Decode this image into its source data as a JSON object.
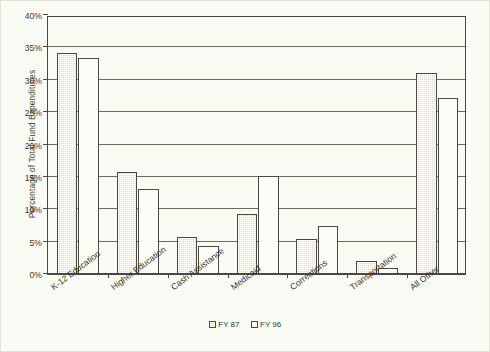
{
  "chart_data": {
    "type": "bar",
    "title": "",
    "subtitle": "",
    "xlabel": "",
    "ylabel": "Percentage of Total Fund Expenditures",
    "ylim": [
      0,
      40
    ],
    "ytick_labels": [
      "0%",
      "5%",
      "10%",
      "15%",
      "20%",
      "25%",
      "30%",
      "35%",
      "40%"
    ],
    "ytick_values": [
      0,
      5,
      10,
      15,
      20,
      25,
      30,
      35,
      40
    ],
    "grid": true,
    "legend_position": "bottom-center",
    "categories": [
      "K-12 Education",
      "Higher Education",
      "Cash Assistance",
      "Medicaid",
      "Corrections",
      "Transportation",
      "All Other"
    ],
    "series": [
      {
        "name": "FY 87",
        "values": [
          34.2,
          15.7,
          5.7,
          9.2,
          5.4,
          2.0,
          31.0
        ]
      },
      {
        "name": "FY 96",
        "values": [
          33.4,
          13.1,
          4.3,
          15.2,
          7.4,
          1.0,
          27.2
        ]
      }
    ],
    "colors": {
      "fy87_fill": "#ded9c8",
      "fy96_fill": "#fdfdf7",
      "bar_border": "#4a4840",
      "gridline": "#6b6a5c",
      "axis": "#4a4840",
      "text": "#36342a",
      "background": "#fbfbf5"
    }
  },
  "legend": {
    "items": [
      {
        "label": "FY 87",
        "swatch": "hatched-square-icon"
      },
      {
        "label": "FY 96",
        "swatch": "empty-square-icon"
      }
    ]
  }
}
